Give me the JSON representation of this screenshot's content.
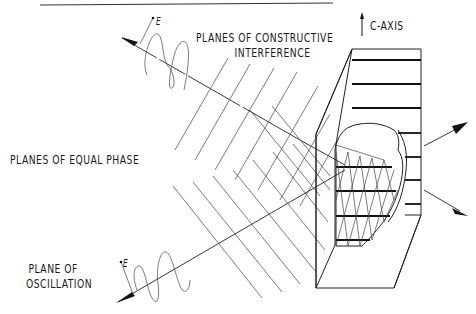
{
  "labels": {
    "constructive_line1": "PLANES OF CONSTRUCTIVE",
    "constructive_line2": "INTERFERENCE",
    "c_axis": "C-AXIS",
    "equal_phase": "PLANES OF EQUAL PHASE",
    "oscillation_line1": "PLANE OF",
    "oscillation_line2": "OSCILLATION",
    "e_field_top": "E",
    "e_field_bottom": "E"
  },
  "elements": {
    "incident_beam_top": "incident wave from upper-left",
    "incident_beam_bottom": "incident wave from lower-left",
    "crystal": "crystal block with cutaway showing lattice planes",
    "diffracted_beam_up": "outgoing arrow upper-right",
    "diffracted_beam_down": "outgoing arrow lower-right"
  },
  "colors": {
    "ink": "#1a1a1a",
    "background": "#ffffff"
  }
}
